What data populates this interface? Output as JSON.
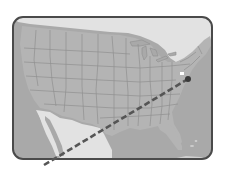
{
  "map": {
    "subject": "Continental United States with Mexico",
    "frame": {
      "x": 12,
      "y": 16,
      "width": 201,
      "height": 144,
      "radius": 11,
      "stroke": "#4a4a4a",
      "stroke_width": 2
    },
    "colors": {
      "background": "#ffffff",
      "land_us": "#b4b4b4",
      "land_foreign": "#e2e2e2",
      "water": "#a9a9a9",
      "state_border": "#8f8f8f",
      "route": "#555555",
      "marker": "#3a3a3a",
      "marker_highlight": "#ffffff"
    },
    "route": {
      "style": "dashed",
      "start": {
        "x": 44,
        "y": 165
      },
      "end": {
        "x": 188,
        "y": 79
      }
    },
    "marker": {
      "x": 188,
      "y": 79,
      "label": ""
    }
  }
}
